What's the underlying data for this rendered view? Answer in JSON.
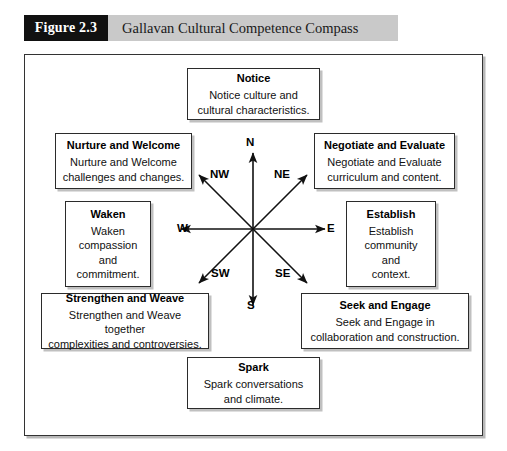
{
  "figure": {
    "number_label": "Figure 2.3",
    "title": "Gallavan Cultural Competence Compass"
  },
  "colors": {
    "figure_number_bg": "#111111",
    "figure_header_bg": "#c9c9c9",
    "frame_border": "#333333",
    "box_border": "#2b2b2b",
    "shadow": "#c0c0c0",
    "text": "#000000"
  },
  "compass": {
    "labels": {
      "n": "N",
      "ne": "NE",
      "e": "E",
      "se": "SE",
      "s": "S",
      "sw": "SW",
      "w": "W",
      "nw": "NW"
    }
  },
  "boxes": {
    "notice": {
      "title": "Notice",
      "body": "Notice culture and\ncultural characteristics."
    },
    "nurture": {
      "title": "Nurture and Welcome",
      "body": "Nurture and Welcome\nchallenges and changes."
    },
    "negotiate": {
      "title": "Negotiate and Evaluate",
      "body": "Negotiate and Evaluate\ncurriculum and content."
    },
    "waken": {
      "title": "Waken",
      "body": "Waken\ncompassion\nand\ncommitment."
    },
    "establish": {
      "title": "Establish",
      "body": "Establish\ncommunity\nand\ncontext."
    },
    "strengthen": {
      "title": "Strengthen and Weave",
      "body": "Strengthen and Weave together\ncomplexities and controversies."
    },
    "seek": {
      "title": "Seek and Engage",
      "body": "Seek and Engage in\ncollaboration and construction."
    },
    "spark": {
      "title": "Spark",
      "body": "Spark conversations\nand climate."
    }
  }
}
